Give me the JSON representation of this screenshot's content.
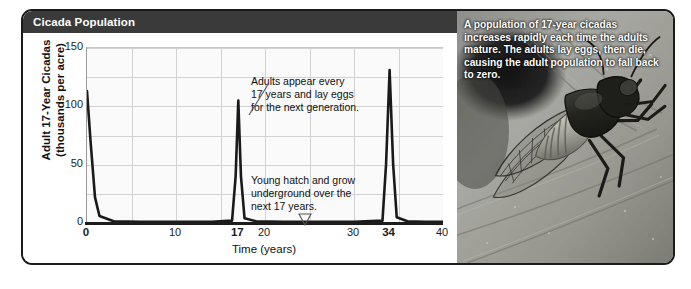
{
  "panel": {
    "title": "Cicada Population"
  },
  "chart_data": {
    "type": "line",
    "title": "Cicada Population",
    "xlabel": "Time (years)",
    "ylabel": "Adult 17-Year Cicadas (thousands per acre)",
    "ylabel_line1": "Adult 17-Year Cicadas",
    "ylabel_line2": "(thousands per acre)",
    "xlim": [
      0,
      40
    ],
    "ylim": [
      0,
      150
    ],
    "yticks": [
      150,
      100,
      50,
      0
    ],
    "xticks": [
      {
        "value": 0,
        "label": "0",
        "bold": true
      },
      {
        "value": 10,
        "label": "10",
        "bold": false
      },
      {
        "value": 17,
        "label": "17",
        "bold": true
      },
      {
        "value": 20,
        "label": "20",
        "bold": false
      },
      {
        "value": 30,
        "label": "30",
        "bold": false
      },
      {
        "value": 34,
        "label": "34",
        "bold": true
      },
      {
        "value": 40,
        "label": "40",
        "bold": false
      }
    ],
    "grid": true,
    "legend": "none",
    "series": [
      {
        "name": "Adult 17-year cicada population",
        "x": [
          0,
          0.4,
          0.9,
          1.4,
          3,
          6,
          10,
          14,
          16.3,
          16.7,
          17,
          17.3,
          17.7,
          19,
          22,
          26,
          30,
          33.2,
          33.6,
          34,
          34.4,
          34.8,
          36,
          38,
          40
        ],
        "values": [
          113,
          70,
          22,
          6,
          1.5,
          1,
          1,
          1,
          2,
          40,
          105,
          40,
          4,
          1.5,
          1,
          1,
          1,
          2,
          50,
          131,
          50,
          5,
          1.5,
          1,
          1
        ]
      }
    ],
    "annotations": [
      {
        "id": "adults-appear",
        "text": "Adults appear every\n17 years and lay eggs\nfor the next generation.",
        "points_to_x": 17
      },
      {
        "id": "young-hatch",
        "text": "Young hatch and grow\nunderground over the\nnext 17 years.",
        "points_to_x": 26
      }
    ]
  },
  "photo": {
    "caption": "A population of 17-year cicadas increases rapidly each time the adults mature. The adults lay eggs, then die, causing the adult population to fall back to zero.",
    "subject": "cicada-on-leaf-photograph"
  }
}
